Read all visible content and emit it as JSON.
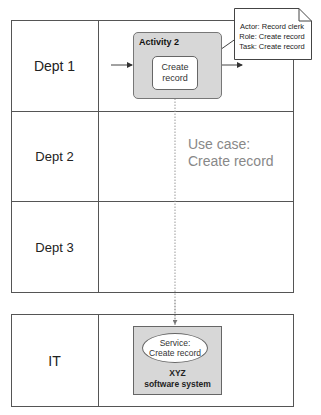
{
  "lanes": [
    {
      "label": "Dept 1"
    },
    {
      "label": "Dept 2"
    },
    {
      "label": "Dept 3"
    }
  ],
  "it_lane": {
    "label": "IT"
  },
  "activity": {
    "title": "Activity 2",
    "task": {
      "line1": "Create",
      "line2": "record"
    }
  },
  "note": {
    "line1": "Actor: Record clerk",
    "line2": "Role: Create record",
    "line3": "Task: Create record"
  },
  "use_case": {
    "line1": "Use case:",
    "line2": "Create record"
  },
  "software_system": {
    "service": {
      "line1": "Service:",
      "line2": "Create record"
    },
    "name_line1": "XYZ",
    "name_line2": "software system"
  },
  "colors": {
    "activity_fill": "#d7d7d7",
    "border": "#555555",
    "use_case_text": "#888888"
  }
}
